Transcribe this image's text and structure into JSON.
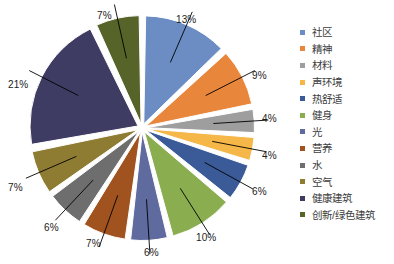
{
  "chart_data": {
    "type": "pie",
    "title": "",
    "subtitle": "",
    "xlabel": "",
    "ylabel": "",
    "legend_position": "right",
    "grid": false,
    "unit": "%",
    "start_angle_deg": 0,
    "direction": "clockwise",
    "categories": [
      "社区",
      "精神",
      "材料",
      "声环境",
      "热舒适",
      "健身",
      "光",
      "营养",
      "水",
      "空气",
      "健康建筑",
      "创新/绿色建筑"
    ],
    "values": [
      13,
      9,
      4,
      4,
      6,
      10,
      6,
      7,
      6,
      7,
      21,
      7
    ],
    "value_labels": [
      "13%",
      "9%",
      "4%",
      "4%",
      "6%",
      "10%",
      "6%",
      "7%",
      "6%",
      "7%",
      "21%",
      "7%"
    ],
    "colors": [
      "#6b8dc4",
      "#e8863c",
      "#9e9e9e",
      "#f5b748",
      "#3a5a98",
      "#8aad50",
      "#5f6a9e",
      "#a0521f",
      "#6e6e6e",
      "#8e7c33",
      "#3f3c63",
      "#56642a"
    ],
    "slices": [
      {
        "label": "社区",
        "value": 13,
        "value_label": "13%",
        "color": "#6b8dc4"
      },
      {
        "label": "精神",
        "value": 9,
        "value_label": "9%",
        "color": "#e8863c"
      },
      {
        "label": "材料",
        "value": 4,
        "value_label": "4%",
        "color": "#9e9e9e"
      },
      {
        "label": "声环境",
        "value": 4,
        "value_label": "4%",
        "color": "#f5b748"
      },
      {
        "label": "热舒适",
        "value": 6,
        "value_label": "6%",
        "color": "#3a5a98"
      },
      {
        "label": "健身",
        "value": 10,
        "value_label": "10%",
        "color": "#8aad50"
      },
      {
        "label": "光",
        "value": 6,
        "value_label": "6%",
        "color": "#5f6a9e"
      },
      {
        "label": "营养",
        "value": 7,
        "value_label": "7%",
        "color": "#a0521f"
      },
      {
        "label": "水",
        "value": 6,
        "value_label": "6%",
        "color": "#6e6e6e"
      },
      {
        "label": "空气",
        "value": 7,
        "value_label": "7%",
        "color": "#8e7c33"
      },
      {
        "label": "健康建筑",
        "value": 21,
        "value_label": "21%",
        "color": "#3f3c63"
      },
      {
        "label": "创新/绿色建筑",
        "value": 7,
        "value_label": "7%",
        "color": "#56642a"
      }
    ]
  },
  "legend": {
    "items": [
      {
        "label": "社区",
        "color": "#6b8dc4"
      },
      {
        "label": "精神",
        "color": "#e8863c"
      },
      {
        "label": "材料",
        "color": "#9e9e9e"
      },
      {
        "label": "声环境",
        "color": "#f5b748"
      },
      {
        "label": "热舒适",
        "color": "#3a5a98"
      },
      {
        "label": "健身",
        "color": "#8aad50"
      },
      {
        "label": "光",
        "color": "#5f6a9e"
      },
      {
        "label": "营养",
        "color": "#a0521f"
      },
      {
        "label": "水",
        "color": "#6e6e6e"
      },
      {
        "label": "空气",
        "color": "#8e7c33"
      },
      {
        "label": "健康建筑",
        "color": "#3f3c63"
      },
      {
        "label": "创新/绿色建筑",
        "color": "#56642a"
      }
    ]
  },
  "labels": [
    {
      "text": "13%",
      "x": 176,
      "y": 14
    },
    {
      "text": "9%",
      "x": 252,
      "y": 70
    },
    {
      "text": "4%",
      "x": 262,
      "y": 113
    },
    {
      "text": "4%",
      "x": 262,
      "y": 150
    },
    {
      "text": "6%",
      "x": 252,
      "y": 186
    },
    {
      "text": "10%",
      "x": 196,
      "y": 232
    },
    {
      "text": "6%",
      "x": 144,
      "y": 247
    },
    {
      "text": "7%",
      "x": 86,
      "y": 238
    },
    {
      "text": "6%",
      "x": 44,
      "y": 222
    },
    {
      "text": "7%",
      "x": 8,
      "y": 182
    },
    {
      "text": "21%",
      "x": 8,
      "y": 79
    },
    {
      "text": "7%",
      "x": 97,
      "y": 10
    }
  ]
}
